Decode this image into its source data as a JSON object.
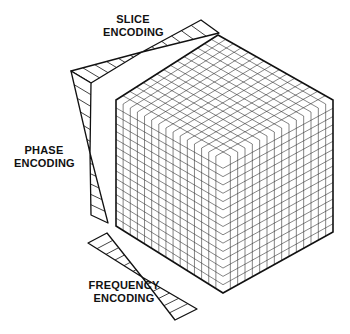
{
  "figure": {
    "colors": {
      "line": "#111111",
      "grid": "#333333",
      "background": "#ffffff"
    }
  },
  "labels": {
    "slice": {
      "line1": "SLICE",
      "line2": "ENCODING"
    },
    "phase": {
      "line1": "PHASE",
      "line2": "ENCODING"
    },
    "frequency": {
      "line1": "FREQUENCY",
      "line2": "ENCODING"
    }
  },
  "cube": {
    "top": [
      218,
      35
    ],
    "left_top": [
      116,
      100
    ],
    "right_top": [
      333,
      100
    ],
    "front": [
      223,
      160
    ],
    "left_bottom": [
      116,
      226
    ],
    "right_bottom": [
      333,
      232
    ],
    "bottom": [
      223,
      293
    ],
    "divisions": 15,
    "vertical_divisions": 16
  },
  "gradients": {
    "slice": {
      "a": [
        [
          201,
          20
        ],
        [
          219,
          33
        ]
      ],
      "b": [
        [
          71,
          71
        ],
        [
          91,
          83
        ]
      ],
      "cross": [
        142,
        52
      ]
    },
    "phase": {
      "a": [
        [
          71,
          71
        ],
        [
          91,
          83
        ]
      ],
      "b": [
        [
          91,
          215
        ],
        [
          108,
          223
        ]
      ],
      "cross": [
        90,
        153
      ]
    },
    "frequency": {
      "a": [
        [
          88,
          243
        ],
        [
          107,
          233
        ]
      ],
      "b": [
        [
          197,
          309
        ],
        [
          175,
          320
        ]
      ],
      "cross": [
        142,
        277
      ]
    }
  }
}
